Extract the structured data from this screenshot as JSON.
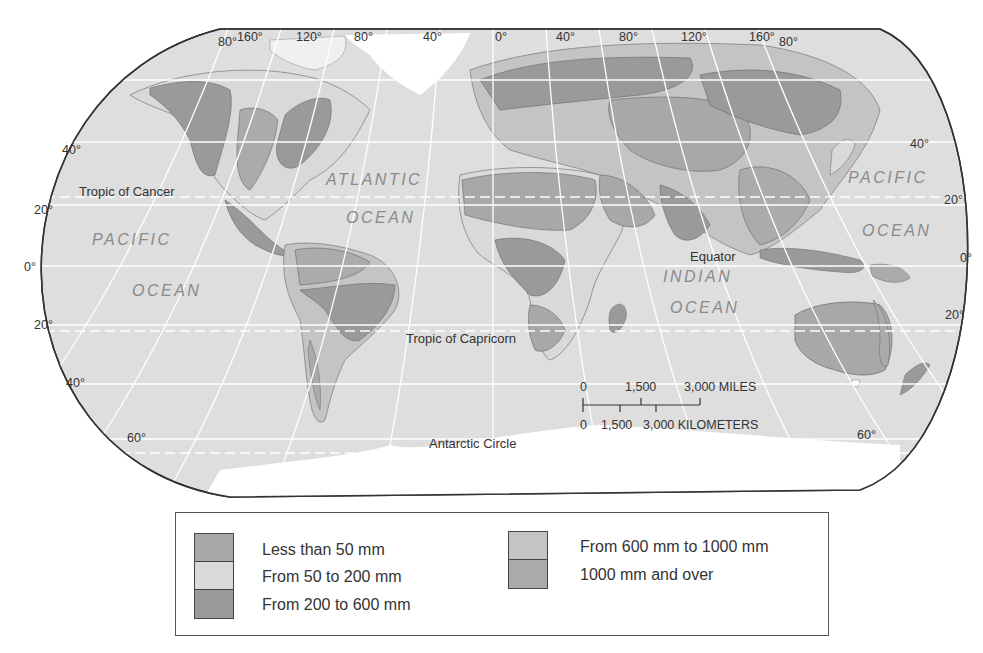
{
  "map": {
    "title": "World precipitation map",
    "projection": "Robinson-style oval",
    "colors": {
      "ocean": "#dedede",
      "outline": "#333333",
      "graticule": "#ffffff",
      "ice": "#ffffff",
      "lt50": "#a8a8a8",
      "50to200": "#d9d9d9",
      "200to600": "#9a9a9a",
      "600to1000": "#c4c4c4",
      "over1000": "#ababab"
    },
    "top_longitudes": [
      "80°",
      "160°",
      "120°",
      "80°",
      "40°",
      "0°",
      "40°",
      "80°",
      "120°",
      "160°",
      "80°"
    ],
    "left_latitudes": [
      "40°",
      "20°",
      "0°",
      "20°",
      "40°",
      "60°"
    ],
    "right_latitudes": [
      "40°",
      "20°",
      "0°",
      "20°",
      "60°"
    ],
    "special_lines": {
      "tropic_cancer": "Tropic of Cancer",
      "tropic_capricorn": "Tropic of Capricorn",
      "equator": "Equator",
      "antarctic_circle": "Antarctic Circle"
    },
    "oceans": {
      "pacific_west_1": "PACIFIC",
      "pacific_west_2": "OCEAN",
      "atlantic_1": "ATLANTIC",
      "atlantic_2": "OCEAN",
      "indian_1": "INDIAN",
      "indian_2": "OCEAN",
      "pacific_east_1": "PACIFIC",
      "pacific_east_2": "OCEAN"
    },
    "scale_bar": {
      "miles_0": "0",
      "miles_mid": "1,500",
      "miles_max": "3,000 MILES",
      "km_0": "0",
      "km_mid": "1,500",
      "km_max": "3,000 KILOMETERS"
    }
  },
  "legend": {
    "items": [
      {
        "label": "Less than 50 mm",
        "color": "#a8a8a8"
      },
      {
        "label": "From 50 to 200 mm",
        "color": "#d9d9d9"
      },
      {
        "label": "From 200 to 600 mm",
        "color": "#9a9a9a"
      },
      {
        "label": "From 600 mm to 1000 mm",
        "color": "#c4c4c4"
      },
      {
        "label": "1000 mm and over",
        "color": "#ababab"
      }
    ]
  }
}
